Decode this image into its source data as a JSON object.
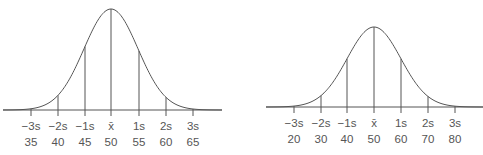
{
  "chart_data": [
    {
      "type": "line",
      "title": "",
      "description": "Normal distribution curve with standard deviation markers",
      "sd_labels": [
        "−3s",
        "−2s",
        "−1s",
        "x̄",
        "1s",
        "2s",
        "3s"
      ],
      "values": [
        "35",
        "40",
        "45",
        "50",
        "55",
        "60",
        "65"
      ],
      "mean": 50,
      "sd": 5,
      "geometry": {
        "baseline": 110,
        "peak": 9,
        "tick_x": [
          31,
          58,
          85,
          111,
          139,
          166,
          193
        ],
        "x_start": 3,
        "x_end": 222,
        "label_y1": 130,
        "label_y2": 146
      }
    },
    {
      "type": "line",
      "title": "",
      "description": "Normal distribution curve with standard deviation markers",
      "sd_labels": [
        "−3s",
        "−2s",
        "−1s",
        "x̄",
        "1s",
        "2s",
        "3s"
      ],
      "values": [
        "20",
        "30",
        "40",
        "50",
        "60",
        "70",
        "80"
      ],
      "mean": 50,
      "sd": 10,
      "geometry": {
        "baseline": 107,
        "peak": 27,
        "tick_x": [
          294,
          321,
          347,
          374,
          401,
          428,
          455
        ],
        "x_start": 266,
        "x_end": 483,
        "label_y1": 127,
        "label_y2": 143
      }
    }
  ]
}
